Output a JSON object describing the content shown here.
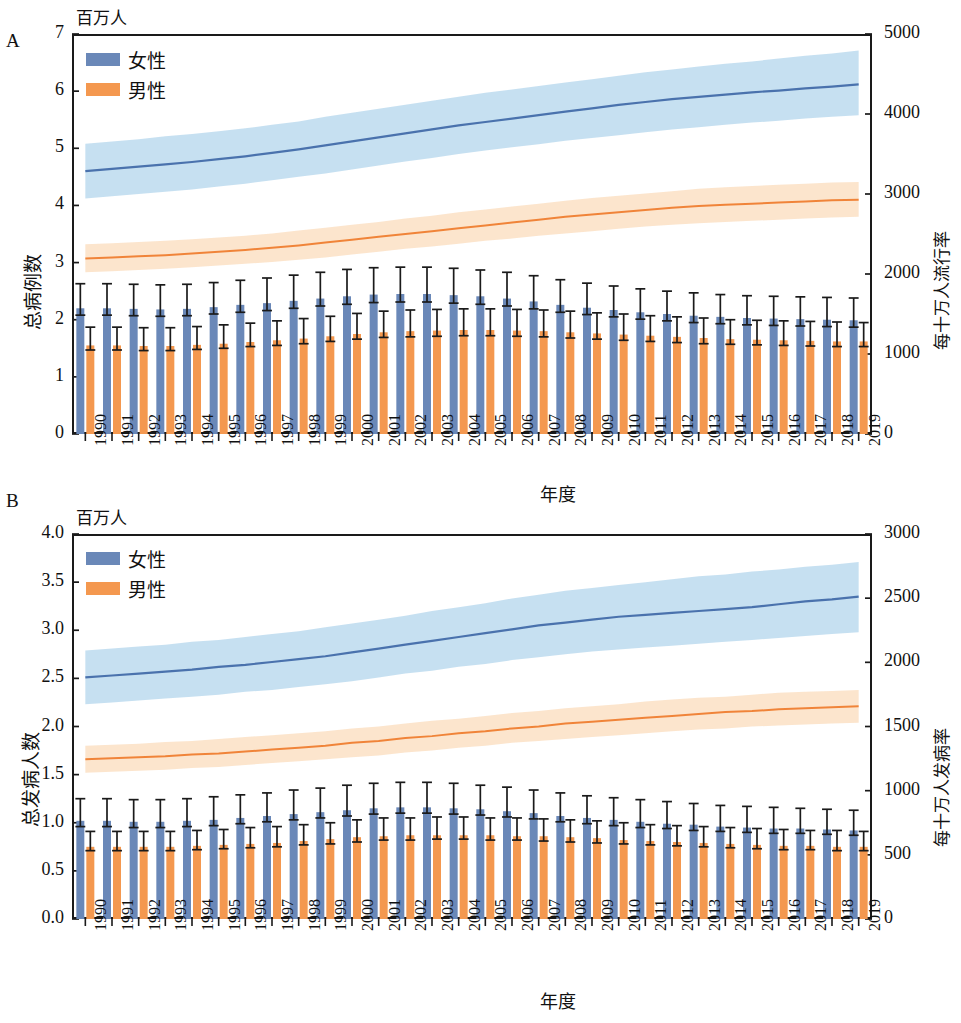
{
  "figure": {
    "panels": [
      {
        "letter": "A",
        "unit_label": "百万人",
        "y_left_title": "总病例数",
        "y_right_title": "每十万人流行率",
        "x_title": "年度",
        "legend": [
          {
            "label": "女性",
            "color": "#6a88b8"
          },
          {
            "label": "男性",
            "color": "#f4984f"
          }
        ],
        "y_left_ticks": [
          "0",
          "1",
          "2",
          "3",
          "4",
          "5",
          "6",
          "7"
        ],
        "y_right_ticks": [
          "0",
          "1000",
          "2000",
          "3000",
          "4000",
          "5000"
        ]
      },
      {
        "letter": "B",
        "unit_label": "百万人",
        "y_left_title": "总发病人数",
        "y_right_title": "每十万人发病率",
        "x_title": "年度",
        "legend": [
          {
            "label": "女性",
            "color": "#6a88b8"
          },
          {
            "label": "男性",
            "color": "#f4984f"
          }
        ],
        "y_left_ticks": [
          "0.0",
          "0.5",
          "1.0",
          "1.5",
          "2.0",
          "2.5",
          "3.0",
          "3.5",
          "4.0"
        ],
        "y_right_ticks": [
          "0",
          "500",
          "1000",
          "1500",
          "2000",
          "2500",
          "3000"
        ]
      }
    ]
  },
  "chart_data": [
    {
      "type": "bar",
      "title": "A",
      "subtitle": "百万人",
      "xlabel": "年度",
      "ylabel": "总病例数",
      "y2label": "每十万人流行率",
      "ylim": [
        0,
        7
      ],
      "y2lim": [
        0,
        5000
      ],
      "ytick_values": [
        0,
        1,
        2,
        3,
        4,
        5,
        6,
        7
      ],
      "y2tick_values": [
        0,
        1000,
        2000,
        3000,
        4000,
        5000
      ],
      "grid": false,
      "legend_position": "top-left",
      "categories": [
        "1990",
        "1991",
        "1992",
        "1993",
        "1994",
        "1995",
        "1996",
        "1997",
        "1998",
        "1999",
        "2000",
        "2001",
        "2002",
        "2003",
        "2004",
        "2005",
        "2006",
        "2007",
        "2008",
        "2009",
        "2010",
        "2011",
        "2012",
        "2013",
        "2014",
        "2015",
        "2016",
        "2017",
        "2018",
        "2019"
      ],
      "series": [
        {
          "name": "女性",
          "kind": "bar",
          "axis": "right",
          "unit": "每十万人流行率",
          "values": [
            2.2,
            2.2,
            2.19,
            2.18,
            2.19,
            2.22,
            2.26,
            2.29,
            2.33,
            2.37,
            2.41,
            2.44,
            2.45,
            2.45,
            2.43,
            2.41,
            2.37,
            2.32,
            2.26,
            2.21,
            2.17,
            2.13,
            2.1,
            2.07,
            2.05,
            2.03,
            2.02,
            2.01,
            2.0,
            1.99
          ],
          "error_low": [
            2.08,
            2.08,
            2.07,
            2.06,
            2.07,
            2.1,
            2.13,
            2.16,
            2.2,
            2.24,
            2.27,
            2.3,
            2.31,
            2.31,
            2.29,
            2.27,
            2.24,
            2.19,
            2.13,
            2.09,
            2.05,
            2.01,
            1.98,
            1.95,
            1.93,
            1.91,
            1.9,
            1.89,
            1.88,
            1.87
          ],
          "error_high": [
            2.63,
            2.63,
            2.62,
            2.61,
            2.62,
            2.65,
            2.69,
            2.73,
            2.78,
            2.83,
            2.88,
            2.91,
            2.92,
            2.92,
            2.9,
            2.87,
            2.83,
            2.77,
            2.7,
            2.64,
            2.59,
            2.54,
            2.5,
            2.47,
            2.44,
            2.42,
            2.41,
            2.4,
            2.39,
            2.38
          ]
        },
        {
          "name": "男性",
          "kind": "bar",
          "axis": "right",
          "unit": "每十万人流行率",
          "values": [
            1.55,
            1.55,
            1.54,
            1.54,
            1.56,
            1.58,
            1.61,
            1.64,
            1.67,
            1.71,
            1.75,
            1.78,
            1.8,
            1.81,
            1.82,
            1.82,
            1.81,
            1.8,
            1.78,
            1.76,
            1.74,
            1.72,
            1.7,
            1.68,
            1.66,
            1.65,
            1.64,
            1.63,
            1.62,
            1.62
          ],
          "error_low": [
            1.47,
            1.47,
            1.46,
            1.46,
            1.48,
            1.5,
            1.53,
            1.55,
            1.58,
            1.62,
            1.66,
            1.69,
            1.7,
            1.71,
            1.72,
            1.72,
            1.71,
            1.7,
            1.68,
            1.66,
            1.64,
            1.62,
            1.6,
            1.58,
            1.57,
            1.56,
            1.55,
            1.54,
            1.53,
            1.53
          ],
          "error_high": [
            1.87,
            1.87,
            1.86,
            1.86,
            1.88,
            1.91,
            1.94,
            1.98,
            2.02,
            2.06,
            2.11,
            2.15,
            2.17,
            2.18,
            2.19,
            2.19,
            2.18,
            2.17,
            2.15,
            2.12,
            2.1,
            2.07,
            2.05,
            2.03,
            2.0,
            1.99,
            1.98,
            1.97,
            1.96,
            1.95
          ]
        },
        {
          "name": "女性趋势",
          "kind": "line",
          "axis": "left",
          "values": [
            4.6,
            4.64,
            4.68,
            4.72,
            4.76,
            4.81,
            4.86,
            4.92,
            4.98,
            5.05,
            5.12,
            5.19,
            5.26,
            5.33,
            5.4,
            5.46,
            5.52,
            5.58,
            5.64,
            5.7,
            5.76,
            5.81,
            5.86,
            5.9,
            5.94,
            5.98,
            6.01,
            6.05,
            6.08,
            6.12
          ],
          "band_low": [
            4.12,
            4.16,
            4.2,
            4.24,
            4.28,
            4.33,
            4.38,
            4.44,
            4.5,
            4.56,
            4.63,
            4.7,
            4.77,
            4.83,
            4.9,
            4.96,
            5.02,
            5.07,
            5.13,
            5.18,
            5.23,
            5.28,
            5.33,
            5.37,
            5.41,
            5.45,
            5.48,
            5.52,
            5.55,
            5.58
          ],
          "band_high": [
            5.08,
            5.12,
            5.16,
            5.21,
            5.25,
            5.3,
            5.35,
            5.41,
            5.47,
            5.55,
            5.62,
            5.69,
            5.76,
            5.83,
            5.9,
            5.97,
            6.03,
            6.09,
            6.15,
            6.21,
            6.27,
            6.33,
            6.38,
            6.43,
            6.48,
            6.52,
            6.57,
            6.62,
            6.66,
            6.71
          ],
          "band_label": "95% 不确定区间"
        },
        {
          "name": "男性趋势",
          "kind": "line",
          "axis": "left",
          "values": [
            3.07,
            3.09,
            3.11,
            3.13,
            3.16,
            3.19,
            3.22,
            3.26,
            3.3,
            3.35,
            3.4,
            3.45,
            3.5,
            3.55,
            3.6,
            3.65,
            3.7,
            3.75,
            3.8,
            3.84,
            3.88,
            3.92,
            3.96,
            3.99,
            4.01,
            4.03,
            4.05,
            4.07,
            4.09,
            4.1
          ],
          "band_low": [
            2.83,
            2.85,
            2.87,
            2.89,
            2.92,
            2.95,
            2.98,
            3.01,
            3.05,
            3.09,
            3.14,
            3.19,
            3.24,
            3.28,
            3.33,
            3.38,
            3.42,
            3.47,
            3.51,
            3.55,
            3.59,
            3.63,
            3.66,
            3.69,
            3.71,
            3.73,
            3.75,
            3.77,
            3.79,
            3.8
          ],
          "band_high": [
            3.32,
            3.34,
            3.36,
            3.38,
            3.41,
            3.44,
            3.47,
            3.51,
            3.56,
            3.61,
            3.66,
            3.71,
            3.77,
            3.82,
            3.88,
            3.93,
            3.98,
            4.03,
            4.08,
            4.13,
            4.17,
            4.21,
            4.25,
            4.29,
            4.32,
            4.34,
            4.36,
            4.38,
            4.4,
            4.41
          ]
        }
      ]
    },
    {
      "type": "bar",
      "title": "B",
      "subtitle": "百万人",
      "xlabel": "年度",
      "ylabel": "总发病人数",
      "y2label": "每十万人发病率",
      "ylim": [
        0,
        4
      ],
      "y2lim": [
        0,
        3000
      ],
      "ytick_values": [
        0.0,
        0.5,
        1.0,
        1.5,
        2.0,
        2.5,
        3.0,
        3.5,
        4.0
      ],
      "y2tick_values": [
        0,
        500,
        1000,
        1500,
        2000,
        2500,
        3000
      ],
      "grid": false,
      "legend_position": "top-left",
      "categories": [
        "1990",
        "1991",
        "1992",
        "1993",
        "1994",
        "1995",
        "1996",
        "1997",
        "1998",
        "1999",
        "2000",
        "2001",
        "2002",
        "2003",
        "2004",
        "2005",
        "2006",
        "2007",
        "2008",
        "2009",
        "2010",
        "2011",
        "2012",
        "2013",
        "2014",
        "2015",
        "2016",
        "2017",
        "2018",
        "2019"
      ],
      "series": [
        {
          "name": "女性",
          "kind": "bar",
          "axis": "right",
          "unit": "每十万人发病率",
          "values": [
            1.02,
            1.02,
            1.01,
            1.01,
            1.02,
            1.03,
            1.05,
            1.07,
            1.09,
            1.11,
            1.13,
            1.15,
            1.16,
            1.16,
            1.15,
            1.14,
            1.12,
            1.1,
            1.07,
            1.05,
            1.03,
            1.01,
            0.99,
            0.98,
            0.96,
            0.95,
            0.94,
            0.94,
            0.93,
            0.92
          ],
          "error_low": [
            0.96,
            0.96,
            0.95,
            0.95,
            0.96,
            0.97,
            0.99,
            1.01,
            1.03,
            1.05,
            1.07,
            1.09,
            1.1,
            1.1,
            1.09,
            1.08,
            1.06,
            1.04,
            1.01,
            0.99,
            0.97,
            0.95,
            0.94,
            0.92,
            0.91,
            0.9,
            0.89,
            0.89,
            0.88,
            0.87
          ],
          "error_high": [
            1.25,
            1.25,
            1.24,
            1.24,
            1.25,
            1.27,
            1.29,
            1.31,
            1.34,
            1.36,
            1.39,
            1.41,
            1.42,
            1.42,
            1.41,
            1.39,
            1.37,
            1.34,
            1.31,
            1.28,
            1.26,
            1.24,
            1.22,
            1.2,
            1.18,
            1.17,
            1.16,
            1.15,
            1.14,
            1.13
          ]
        },
        {
          "name": "男性",
          "kind": "bar",
          "axis": "right",
          "unit": "每十万人发病率",
          "values": [
            0.75,
            0.75,
            0.75,
            0.75,
            0.76,
            0.77,
            0.78,
            0.79,
            0.81,
            0.83,
            0.85,
            0.86,
            0.87,
            0.87,
            0.87,
            0.87,
            0.86,
            0.86,
            0.85,
            0.84,
            0.82,
            0.81,
            0.8,
            0.79,
            0.78,
            0.77,
            0.76,
            0.76,
            0.75,
            0.75
          ],
          "error_low": [
            0.71,
            0.71,
            0.71,
            0.71,
            0.72,
            0.73,
            0.74,
            0.75,
            0.77,
            0.78,
            0.8,
            0.82,
            0.82,
            0.83,
            0.83,
            0.82,
            0.82,
            0.81,
            0.8,
            0.79,
            0.78,
            0.77,
            0.76,
            0.75,
            0.74,
            0.73,
            0.72,
            0.72,
            0.71,
            0.71
          ],
          "error_high": [
            0.91,
            0.91,
            0.91,
            0.91,
            0.92,
            0.93,
            0.95,
            0.96,
            0.98,
            1.0,
            1.03,
            1.05,
            1.05,
            1.06,
            1.06,
            1.05,
            1.05,
            1.04,
            1.03,
            1.02,
            1.0,
            0.98,
            0.97,
            0.96,
            0.95,
            0.94,
            0.93,
            0.92,
            0.92,
            0.91
          ]
        },
        {
          "name": "女性趋势",
          "kind": "line",
          "axis": "left",
          "values": [
            2.51,
            2.53,
            2.55,
            2.57,
            2.59,
            2.62,
            2.64,
            2.67,
            2.7,
            2.73,
            2.77,
            2.81,
            2.85,
            2.89,
            2.93,
            2.97,
            3.01,
            3.05,
            3.08,
            3.11,
            3.14,
            3.16,
            3.18,
            3.2,
            3.22,
            3.24,
            3.27,
            3.3,
            3.32,
            3.35
          ],
          "band_low": [
            2.23,
            2.25,
            2.27,
            2.29,
            2.31,
            2.33,
            2.36,
            2.38,
            2.41,
            2.44,
            2.47,
            2.51,
            2.55,
            2.58,
            2.62,
            2.65,
            2.69,
            2.72,
            2.75,
            2.78,
            2.8,
            2.82,
            2.84,
            2.86,
            2.88,
            2.9,
            2.92,
            2.94,
            2.96,
            2.98
          ],
          "band_high": [
            2.79,
            2.81,
            2.83,
            2.85,
            2.88,
            2.9,
            2.93,
            2.96,
            2.99,
            3.03,
            3.07,
            3.11,
            3.15,
            3.2,
            3.24,
            3.28,
            3.33,
            3.37,
            3.41,
            3.44,
            3.47,
            3.5,
            3.53,
            3.56,
            3.58,
            3.61,
            3.63,
            3.66,
            3.68,
            3.71
          ]
        },
        {
          "name": "男性趋势",
          "kind": "line",
          "axis": "left",
          "values": [
            1.66,
            1.67,
            1.68,
            1.69,
            1.71,
            1.72,
            1.74,
            1.76,
            1.78,
            1.8,
            1.83,
            1.85,
            1.88,
            1.9,
            1.93,
            1.95,
            1.98,
            2.0,
            2.03,
            2.05,
            2.07,
            2.09,
            2.11,
            2.13,
            2.15,
            2.16,
            2.18,
            2.19,
            2.2,
            2.21
          ],
          "band_low": [
            1.52,
            1.53,
            1.54,
            1.55,
            1.57,
            1.58,
            1.6,
            1.62,
            1.64,
            1.66,
            1.68,
            1.7,
            1.73,
            1.75,
            1.78,
            1.8,
            1.83,
            1.85,
            1.87,
            1.89,
            1.91,
            1.93,
            1.95,
            1.97,
            1.98,
            2.0,
            2.01,
            2.02,
            2.03,
            2.04
          ],
          "band_high": [
            1.8,
            1.81,
            1.82,
            1.84,
            1.85,
            1.87,
            1.89,
            1.91,
            1.93,
            1.95,
            1.98,
            2.0,
            2.03,
            2.06,
            2.08,
            2.11,
            2.14,
            2.16,
            2.19,
            2.21,
            2.23,
            2.26,
            2.28,
            2.3,
            2.31,
            2.33,
            2.35,
            2.36,
            2.37,
            2.38
          ]
        }
      ]
    }
  ]
}
